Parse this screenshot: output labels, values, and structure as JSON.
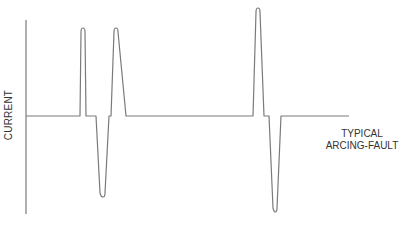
{
  "diagram": {
    "y_axis_label": "CURRENT",
    "caption": {
      "line1": "TYPICAL",
      "line2": "ARCING-FAULT"
    },
    "colors": {
      "waveform": "#7a7a7a",
      "axis": "#7a7a7a",
      "text": "#333333",
      "background": "#ffffff"
    },
    "waveform_description": "Current waveform with intermittent positive and negative spikes on a flat baseline, illustrating a typical arcing fault"
  }
}
